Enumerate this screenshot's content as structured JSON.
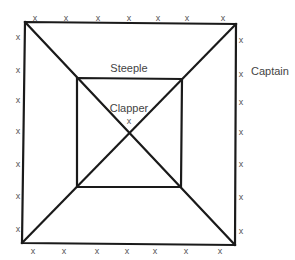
{
  "diagram": {
    "type": "nested-squares-with-diagonals",
    "outer_square": {
      "tl": [
        25,
        22
      ],
      "tr": [
        236,
        24
      ],
      "br": [
        235,
        245
      ],
      "bl": [
        22,
        243
      ]
    },
    "inner_square": {
      "tl": [
        77,
        78
      ],
      "tr": [
        182,
        79
      ],
      "br": [
        181,
        187
      ],
      "bl": [
        77,
        187
      ]
    },
    "labels": {
      "steeple": "Steeple",
      "clapper": "Clapper",
      "clapper_mark": "x",
      "captain": "Captain"
    },
    "mark_glyph": "x",
    "marks": {
      "top": [
        [
          35,
          18
        ],
        [
          66,
          18
        ],
        [
          98,
          18
        ],
        [
          129,
          18
        ],
        [
          158,
          18
        ],
        [
          187,
          18
        ],
        [
          223,
          18
        ]
      ],
      "bottom": [
        [
          33,
          251
        ],
        [
          64,
          251
        ],
        [
          97,
          251
        ],
        [
          127,
          251
        ],
        [
          155,
          251
        ],
        [
          186,
          251
        ],
        [
          220,
          251
        ]
      ],
      "left": [
        [
          18,
          37
        ],
        [
          18,
          70
        ],
        [
          18,
          100
        ],
        [
          18,
          131
        ],
        [
          18,
          164
        ],
        [
          18,
          196
        ],
        [
          18,
          229
        ]
      ],
      "right": [
        [
          241,
          40
        ],
        [
          241,
          74
        ],
        [
          241,
          102
        ],
        [
          241,
          132
        ],
        [
          241,
          164
        ],
        [
          241,
          197
        ],
        [
          241,
          231
        ]
      ]
    },
    "colors": {
      "line": "#1a1a1a",
      "mark": "#555555",
      "label": "#444444"
    }
  }
}
